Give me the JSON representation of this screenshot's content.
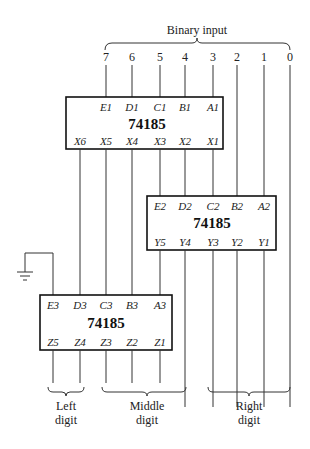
{
  "title": "Binary input",
  "input_bits": [
    "7",
    "6",
    "5",
    "4",
    "3",
    "2",
    "1",
    "0"
  ],
  "chips": {
    "top": {
      "part": "74185",
      "inputs": [
        "E1",
        "D1",
        "C1",
        "B1",
        "A1"
      ],
      "outputs": [
        "X6",
        "X5",
        "X4",
        "X3",
        "X2",
        "X1"
      ]
    },
    "middle": {
      "part": "74185",
      "inputs": [
        "E2",
        "D2",
        "C2",
        "B2",
        "A2"
      ],
      "outputs": [
        "Y5",
        "Y4",
        "Y3",
        "Y2",
        "Y1"
      ]
    },
    "bottom": {
      "part": "74185",
      "inputs": [
        "E3",
        "D3",
        "C3",
        "B3",
        "A3"
      ],
      "outputs": [
        "Z5",
        "Z4",
        "Z3",
        "Z2",
        "Z1"
      ]
    }
  },
  "output_groups": {
    "left": [
      "Left",
      "digit"
    ],
    "middle": [
      "Middle",
      "digit"
    ],
    "right": [
      "Right",
      "digit"
    ]
  }
}
